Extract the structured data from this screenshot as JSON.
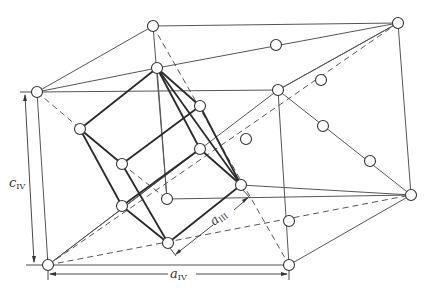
{
  "figure": {
    "labels": {
      "c_iv": {
        "main": "c",
        "sub": "IV"
      },
      "a_iv": {
        "main": "a",
        "sub": "IV"
      },
      "a_iii": {
        "main": "a",
        "sub": "III"
      }
    },
    "colors": {
      "line": "#555555",
      "cube_line": "#2a2a2a",
      "atom_fill": "#ffffff",
      "background": "#ffffff"
    }
  }
}
